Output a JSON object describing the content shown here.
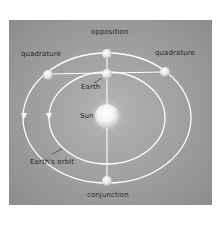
{
  "diagram": {
    "labels": {
      "opposition": "opposition",
      "quadrature_left": "quadrature",
      "quadrature_right": "quadrature",
      "earth": "Earth",
      "sun": "Sun",
      "earths_orbit": "Earth's orbit",
      "conjunction": "conjunction"
    },
    "bodies": [
      {
        "name": "Sun",
        "x": 107,
        "y": 116,
        "r": 12
      },
      {
        "name": "Earth",
        "x": 107,
        "y": 74,
        "r": 5
      },
      {
        "name": "planet-opposition",
        "x": 107,
        "y": 54,
        "r": 5
      },
      {
        "name": "planet-quadrature-left",
        "x": 48,
        "y": 75,
        "r": 5
      },
      {
        "name": "planet-quadrature-right",
        "x": 165,
        "y": 72,
        "r": 5
      },
      {
        "name": "planet-conjunction",
        "x": 107,
        "y": 181,
        "r": 5
      }
    ],
    "orbits": [
      {
        "name": "planet-orbit",
        "cx": 107,
        "cy": 118,
        "rx": 84,
        "ry": 65
      },
      {
        "name": "earth-orbit",
        "cx": 107,
        "cy": 118,
        "rx": 58,
        "ry": 46
      }
    ],
    "colors": {
      "panel_center": "#b4b4b4",
      "panel_edge": "#8c8c8c",
      "orbit_line": "#ffffff",
      "text": "#262626"
    }
  }
}
